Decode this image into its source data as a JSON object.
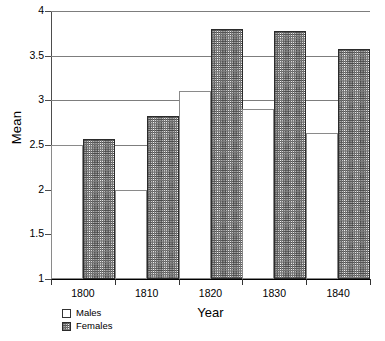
{
  "chart_data": {
    "type": "bar",
    "title": "",
    "xlabel": "Year",
    "ylabel": "Mean",
    "categories": [
      "1800",
      "1810",
      "1820",
      "1830",
      "1840"
    ],
    "series": [
      {
        "name": "Males",
        "values": [
          2.5,
          2.0,
          3.1,
          2.9,
          2.63
        ]
      },
      {
        "name": "Females",
        "values": [
          2.57,
          2.83,
          3.8,
          3.78,
          3.58
        ]
      }
    ],
    "ylim": [
      1,
      4
    ],
    "yticks": [
      "1",
      "1.5",
      "2",
      "2.5",
      "3",
      "3.5",
      "4"
    ],
    "ytick_values": [
      1,
      1.5,
      2,
      2.5,
      3,
      3.5,
      4
    ],
    "grid": true,
    "legend_position": "bottom-left",
    "legend": [
      {
        "label": "Males",
        "swatch": "white-open-square"
      },
      {
        "label": "Females",
        "swatch": "hatched-square"
      }
    ],
    "colors": {
      "males_fill": "#ffffff",
      "males_border": "#8a8a8a",
      "females_hatch": "#4a4a4a",
      "females_border": "#2b2b2b",
      "gridline": "#7d7d7d",
      "axis": "#000000"
    }
  }
}
